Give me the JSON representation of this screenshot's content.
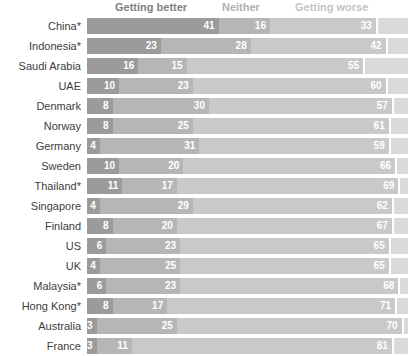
{
  "chart_data": {
    "type": "bar",
    "orientation": "horizontal-stacked",
    "title": "",
    "xlabel": "",
    "ylabel": "",
    "xlim": [
      0,
      100
    ],
    "grid": false,
    "legend_position": "top",
    "value_label_color": "#ffffff",
    "remainder_color": "#d9d9d9",
    "unlabeled_remainder": true,
    "categories": [
      "China*",
      "Indonesia*",
      "Saudi Arabia",
      "UAE",
      "Denmark",
      "Norway",
      "Germany",
      "Sweden",
      "Thailand*",
      "Singapore",
      "Finland",
      "US",
      "UK",
      "Malaysia*",
      "Hong Kong*",
      "Australia",
      "France"
    ],
    "series": [
      {
        "name": "Getting better",
        "color": "#9b9b9b",
        "label_color": "#7f7f7f",
        "values": [
          41,
          23,
          16,
          10,
          8,
          8,
          4,
          10,
          11,
          4,
          8,
          6,
          4,
          6,
          8,
          3,
          3
        ]
      },
      {
        "name": "Neither",
        "color": "#b6b6b6",
        "label_color": "#b2b2b2",
        "values": [
          16,
          28,
          15,
          23,
          30,
          25,
          31,
          20,
          17,
          29,
          20,
          23,
          25,
          23,
          17,
          25,
          11
        ]
      },
      {
        "name": "Getting worse",
        "color": "#c9c9c9",
        "label_color": "#c4c4c4",
        "values": [
          33,
          42,
          55,
          60,
          57,
          61,
          59,
          66,
          69,
          62,
          67,
          65,
          65,
          68,
          71,
          70,
          81
        ]
      }
    ]
  }
}
